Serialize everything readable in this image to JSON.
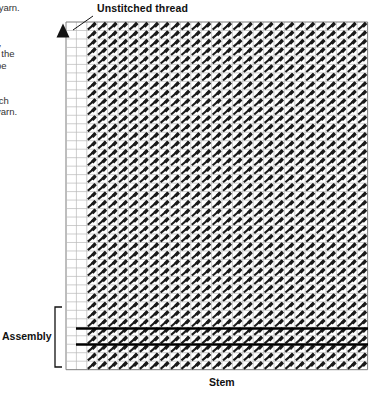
{
  "canvas": {
    "width": 377,
    "height": 394,
    "background": "#ffffff"
  },
  "colors": {
    "ink": "#111111",
    "grid_line": "#b9b9b9",
    "grid_border": "#7d7d7d",
    "stitch": "#1a1a1a",
    "assembly_line": "#000000",
    "body_text": "#333333"
  },
  "labels": {
    "unstitched_thread": "Unstitched thread",
    "stem": "Stem",
    "assembly": "Assembly"
  },
  "side_text": {
    "note": "Paragraph text clipped by the left edge of the screenshot.",
    "lines": [
      " yarn.",
      ")",
      "",
      "t,",
      "t the",
      "be",
      "",
      "",
      "tch",
      "yarn."
    ]
  },
  "chart_data": {
    "type": "heatmap",
    "title": "Unstitched thread",
    "xlabel": "Stem",
    "ylabel": "",
    "grid": true,
    "legend_position": "none",
    "columns": 29,
    "rows": 41,
    "cell_width": 10.4,
    "cell_height": 8.48,
    "origin": {
      "x": 66,
      "y": 22
    },
    "empty_left_columns": 2,
    "stitch_symbol": "diagonal-stroke-up-right",
    "annotations": [
      {
        "name": "unstitched-thread-leader",
        "from": [
          93,
          16
        ],
        "to": [
          73,
          30
        ]
      },
      {
        "name": "direction-marker",
        "shape": "triangle-up",
        "x": 63,
        "y": 31
      },
      {
        "name": "assembly-bracket",
        "x": 55,
        "y_top": 307,
        "y_bottom": 367
      }
    ],
    "assembly_rows": [
      {
        "name": "assembly-line-upper",
        "y": 328.5,
        "x_start": 76,
        "x_end": 368,
        "thickness": 2.6
      },
      {
        "name": "assembly-line-lower",
        "y": 344.5,
        "x_start": 76,
        "x_end": 368,
        "thickness": 2.6
      }
    ]
  }
}
